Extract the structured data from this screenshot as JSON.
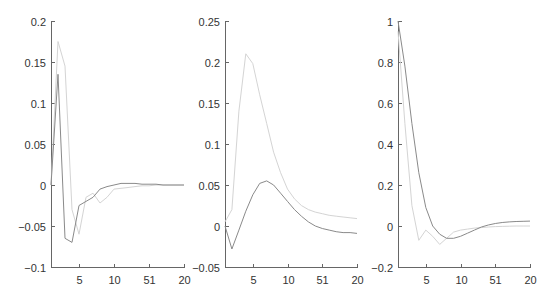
{
  "colors": {
    "dark_series": "#8a8a8a",
    "light_series": "#d4d4d4",
    "axis": "#666666",
    "text": "#333333"
  },
  "chart_data": [
    {
      "type": "line",
      "title": "",
      "xlabel": "",
      "ylabel": "",
      "xlim": [
        1,
        20
      ],
      "ylim": [
        -0.1,
        0.2
      ],
      "grid": false,
      "legend": null,
      "x_ticks": [
        5,
        10,
        15,
        20
      ],
      "x_tick_labels": [
        "5",
        "10",
        "51",
        "20"
      ],
      "y_ticks": [
        -0.1,
        -0.05,
        0,
        0.05,
        0.1,
        0.15,
        0.2
      ],
      "y_tick_labels": [
        "-0.1",
        "-0.05",
        "0",
        "0.05",
        "0.1",
        "0.15",
        "0.2"
      ],
      "x": [
        1,
        2,
        3,
        4,
        5,
        6,
        7,
        8,
        9,
        10,
        11,
        12,
        13,
        14,
        15,
        16,
        17,
        18,
        19,
        20
      ],
      "series": [
        {
          "name": "dark",
          "color": "#8a8a8a",
          "values": [
            0.0,
            0.135,
            -0.065,
            -0.07,
            -0.025,
            -0.02,
            -0.015,
            -0.005,
            -0.002,
            0.0,
            0.002,
            0.002,
            0.002,
            0.001,
            0.001,
            0.001,
            0.0,
            0.0,
            0.0,
            0.0
          ]
        },
        {
          "name": "light",
          "color": "#d4d4d4",
          "values": [
            0.0,
            0.175,
            0.145,
            -0.03,
            -0.06,
            -0.015,
            -0.01,
            -0.022,
            -0.015,
            -0.005,
            -0.004,
            -0.003,
            -0.002,
            -0.001,
            -0.001,
            0.0,
            0.0,
            0.0,
            0.0,
            0.0
          ]
        }
      ]
    },
    {
      "type": "line",
      "title": "",
      "xlabel": "",
      "ylabel": "",
      "xlim": [
        1,
        20
      ],
      "ylim": [
        -0.05,
        0.25
      ],
      "grid": false,
      "legend": null,
      "x_ticks": [
        5,
        10,
        15,
        20
      ],
      "x_tick_labels": [
        "5",
        "10",
        "51",
        "20"
      ],
      "y_ticks": [
        -0.05,
        0,
        0.05,
        0.1,
        0.15,
        0.2,
        0.25
      ],
      "y_tick_labels": [
        "-0.05",
        "0",
        "0.05",
        "0.1",
        "0.15",
        "0.2",
        "0.25"
      ],
      "x": [
        1,
        2,
        3,
        4,
        5,
        6,
        7,
        8,
        9,
        10,
        11,
        12,
        13,
        14,
        15,
        16,
        17,
        18,
        19,
        20
      ],
      "series": [
        {
          "name": "dark",
          "color": "#8a8a8a",
          "values": [
            0.0,
            -0.028,
            -0.005,
            0.018,
            0.038,
            0.052,
            0.055,
            0.05,
            0.04,
            0.03,
            0.02,
            0.012,
            0.005,
            0.0,
            -0.003,
            -0.005,
            -0.007,
            -0.008,
            -0.008,
            -0.009
          ]
        },
        {
          "name": "light",
          "color": "#d4d4d4",
          "values": [
            0.005,
            0.02,
            0.14,
            0.21,
            0.198,
            0.16,
            0.125,
            0.09,
            0.065,
            0.045,
            0.033,
            0.025,
            0.02,
            0.017,
            0.015,
            0.013,
            0.012,
            0.011,
            0.01,
            0.009
          ]
        }
      ]
    },
    {
      "type": "line",
      "title": "",
      "xlabel": "",
      "ylabel": "",
      "xlim": [
        1,
        20
      ],
      "ylim": [
        -0.2,
        1
      ],
      "grid": false,
      "legend": null,
      "x_ticks": [
        5,
        10,
        15,
        20
      ],
      "x_tick_labels": [
        "5",
        "10",
        "51",
        "20"
      ],
      "y_ticks": [
        -0.2,
        0,
        0.2,
        0.4,
        0.6,
        0.8,
        1
      ],
      "y_tick_labels": [
        "-0.2",
        "0",
        "0.2",
        "0.4",
        "0.6",
        "0.8",
        "1"
      ],
      "x": [
        1,
        2,
        3,
        4,
        5,
        6,
        7,
        8,
        9,
        10,
        11,
        12,
        13,
        14,
        15,
        16,
        17,
        18,
        19,
        20
      ],
      "series": [
        {
          "name": "dark",
          "color": "#8a8a8a",
          "values": [
            1.0,
            0.78,
            0.5,
            0.26,
            0.09,
            0.0,
            -0.04,
            -0.06,
            -0.06,
            -0.05,
            -0.035,
            -0.02,
            -0.005,
            0.005,
            0.012,
            0.017,
            0.02,
            0.022,
            0.023,
            0.024
          ]
        },
        {
          "name": "light",
          "color": "#d4d4d4",
          "values": [
            0.95,
            0.5,
            0.1,
            -0.07,
            -0.02,
            -0.05,
            -0.09,
            -0.06,
            -0.03,
            -0.02,
            -0.015,
            -0.01,
            -0.008,
            -0.005,
            -0.003,
            -0.002,
            -0.001,
            0.0,
            0.0,
            0.0
          ]
        }
      ]
    }
  ]
}
